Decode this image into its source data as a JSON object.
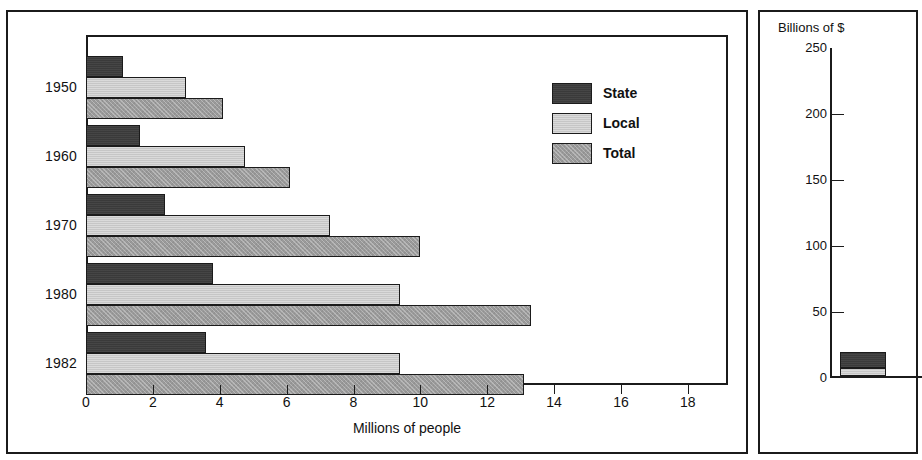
{
  "chart_data": [
    {
      "id": "left",
      "type": "bar",
      "orientation": "horizontal",
      "title": "",
      "xlabel": "Millions of people",
      "ylabel": "",
      "xlim": [
        0,
        19.2
      ],
      "xticks": [
        0,
        2,
        4,
        6,
        8,
        10,
        12,
        14,
        16,
        18
      ],
      "xticklabels": [
        "0",
        "2",
        "4",
        "6",
        "8",
        "10",
        "12",
        "14",
        "16",
        "18"
      ],
      "categories": [
        "1950",
        "1960",
        "1970",
        "1980",
        "1982"
      ],
      "grid": false,
      "legend_position": "center-right",
      "series": [
        {
          "name": "State",
          "color": "#3a3a3a",
          "values": [
            1.1,
            1.6,
            2.35,
            3.8,
            3.6
          ]
        },
        {
          "name": "Local",
          "color": "#c6c6c6",
          "values": [
            3.0,
            4.75,
            7.3,
            9.4,
            9.4
          ]
        },
        {
          "name": "Total",
          "color": "#9a9a9a",
          "values": [
            4.1,
            6.1,
            10.0,
            13.3,
            13.1
          ]
        }
      ]
    },
    {
      "id": "right",
      "type": "bar",
      "orientation": "vertical",
      "stacked": true,
      "title": "Billions of $",
      "xlabel": "",
      "ylabel": "",
      "ylim": [
        0,
        250
      ],
      "yticks": [
        0,
        50,
        100,
        150,
        200,
        250
      ],
      "yticklabels": [
        "0",
        "50",
        "100",
        "150",
        "200",
        "250"
      ],
      "categories": [
        "1950",
        "1"
      ],
      "grid": false,
      "legend_position": "top-right",
      "note": "panel is cropped at the right edge of the screenshot",
      "series": [
        {
          "name": "State",
          "color": "#3a3a3a",
          "values": [
            12,
            18
          ]
        },
        {
          "name": "Local",
          "color": "#c6c6c6",
          "values": [
            6,
            8
          ]
        }
      ]
    }
  ],
  "left_panel": {
    "xaxis_title": "Millions of people",
    "xticklabels": [
      "0",
      "2",
      "4",
      "6",
      "8",
      "10",
      "12",
      "14",
      "16",
      "18"
    ],
    "yticklabels": [
      "1950",
      "1960",
      "1970",
      "1980",
      "1982"
    ],
    "legend": [
      {
        "label": "State",
        "swatch": "dark-gray"
      },
      {
        "label": "Local",
        "swatch": "light-gray"
      },
      {
        "label": "Total",
        "swatch": "medium-gray"
      }
    ]
  },
  "right_panel": {
    "axis_title": "Billions of $",
    "yticklabels": [
      "250",
      "200",
      "150",
      "100",
      "50",
      "0"
    ],
    "xticklabels": [
      "1950",
      "1"
    ],
    "legend": [
      {
        "label": "",
        "swatch": "dark-gray"
      },
      {
        "label": "",
        "swatch": "light-gray"
      }
    ]
  },
  "colors": {
    "state": "#3a3a3a",
    "local": "#c6c6c6",
    "total": "#9a9a9a",
    "outline": "#1b1b1b",
    "background": "#ffffff"
  }
}
